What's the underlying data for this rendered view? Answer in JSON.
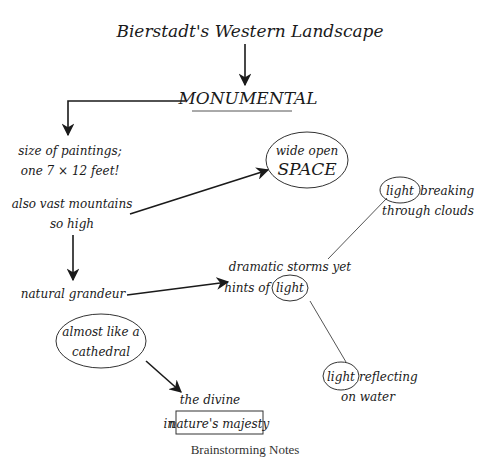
{
  "diagram": {
    "title": "Bierstadt's Western Landscape",
    "central": "MONUMENTAL",
    "nodes": {
      "size_line1": "size of paintings;",
      "size_line2": "one 7 × 12 feet!",
      "mountains_line1": "also vast mountains",
      "mountains_line2": "so high",
      "grandeur": "natural grandeur",
      "space_line1": "wide open",
      "space_line2": "SPACE",
      "storms_line1": "dramatic storms yet",
      "storms_line2_prefix": "hints of",
      "storms_line2_circled": "light",
      "clouds_circled": "light",
      "clouds_line1_rest": "breaking",
      "clouds_line2": "through clouds",
      "water_circled": "light",
      "water_line1_rest": "reflecting",
      "water_line2": "on water",
      "cathedral_line1": "almost like a",
      "cathedral_line2": "cathedral",
      "divine_line1": "the divine",
      "divine_line2_prefix": "in",
      "divine_line2_boxed": "nature's majesty"
    },
    "caption": "Brainstorming Notes"
  }
}
